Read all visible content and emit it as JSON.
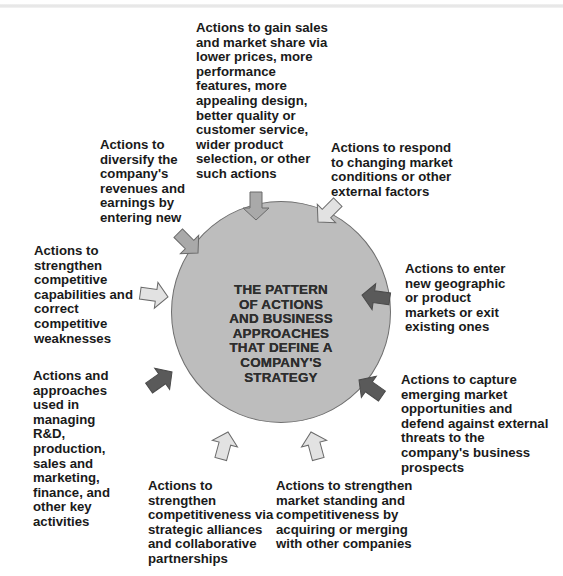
{
  "diagram": {
    "center": {
      "text": "THE PATTERN\nOF ACTIONS\nAND BUSINESS\nAPPROACHES\nTHAT DEFINE A\nCOMPANY'S\nSTRATEGY",
      "fill_color": "#bdbdbd",
      "border_color": "#6f6f6f"
    },
    "nodes": [
      {
        "id": "sales-share",
        "text": "Actions to gain sales\nand market share via\nlower prices, more\nperformance\nfeatures, more\nappealing design,\nbetter quality or\ncustomer service,\nwider product\nselection, or other\nsuch actions",
        "arrow_shade": "medium"
      },
      {
        "id": "respond-market",
        "text": "Actions to respond\nto changing market\nconditions or other\nexternal factors",
        "arrow_shade": "light"
      },
      {
        "id": "enter-markets",
        "text": "Actions to enter\nnew geographic\nor product\nmarkets or exit\nexisting ones",
        "arrow_shade": "dark"
      },
      {
        "id": "capture-opportunities",
        "text": "Actions to capture\nemerging market\nopportunities and\ndefend against external\nthreats to the\ncompany's business\nprospects",
        "arrow_shade": "dark"
      },
      {
        "id": "acquire-merge",
        "text": "Actions to strengthen\nmarket standing and\ncompetitiveness by\nacquiring or merging\nwith other companies",
        "arrow_shade": "light"
      },
      {
        "id": "alliances",
        "text": "Actions to\nstrengthen\ncompetitiveness via\nstrategic alliances\nand collaborative\npartnerships",
        "arrow_shade": "light"
      },
      {
        "id": "manage-functions",
        "text": "Actions and\napproaches\nused in\nmanaging\nR&D,\nproduction,\nsales and\nmarketing,\nfinance, and\nother key\nactivities",
        "arrow_shade": "dark"
      },
      {
        "id": "strengthen-capabilities",
        "text": "Actions to\nstrengthen\ncompetitive\ncapabilities and\ncorrect\ncompetitive\nweaknesses",
        "arrow_shade": "light"
      },
      {
        "id": "diversify",
        "text": "Actions to\ndiversify the\ncompany's\nrevenues and\nearnings by\nentering new",
        "arrow_shade": "medium"
      }
    ],
    "arrow_colors": {
      "light": "#e2e2e2",
      "medium": "#a9a9a9",
      "dark": "#5a5a5a",
      "outline": "#6a6a6a"
    }
  }
}
